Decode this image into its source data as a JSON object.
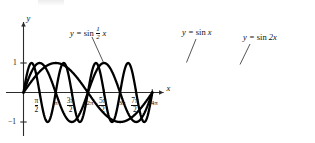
{
  "figure": {
    "axes": {
      "x_axis_label": "x",
      "y_axis_label": "y",
      "x_ticks": [
        {
          "value_pi": 0.5,
          "label_num": "π",
          "label_den": "2",
          "is_fraction": true
        },
        {
          "value_pi": 1.0,
          "label": "π",
          "is_fraction": false
        },
        {
          "value_pi": 1.5,
          "label_num": "3π",
          "label_den": "2",
          "is_fraction": true
        },
        {
          "value_pi": 2.0,
          "label": "2π",
          "is_fraction": false
        },
        {
          "value_pi": 2.5,
          "label_num": "5π",
          "label_den": "2",
          "is_fraction": true
        },
        {
          "value_pi": 3.0,
          "label": "3π",
          "is_fraction": false
        },
        {
          "value_pi": 3.5,
          "label_num": "7π",
          "label_den": "2",
          "is_fraction": true
        },
        {
          "value_pi": 4.0,
          "label": "4π",
          "is_fraction": false
        }
      ],
      "y_ticks": [
        {
          "value": 1,
          "label": "1"
        },
        {
          "value": -1,
          "label": "−1"
        }
      ],
      "xlim_pi": [
        0,
        4.35
      ],
      "ylim": [
        -1.35,
        1.35
      ],
      "grid": false
    },
    "curve_labels": [
      {
        "id": "sin-half-x",
        "prefix": "y = ",
        "fn": "sin ",
        "num": "1",
        "den": "2",
        "suffix": " x",
        "is_fraction": true
      },
      {
        "id": "sin-x",
        "prefix": "y = ",
        "fn": "sin ",
        "suffix": " x",
        "is_fraction": false
      },
      {
        "id": "sin-2x",
        "prefix": "y = ",
        "fn": "sin ",
        "suffix": " 2x",
        "is_fraction": false
      }
    ]
  },
  "chart_data": {
    "type": "line",
    "title": "",
    "xlabel": "x",
    "ylabel": "y",
    "xlim": [
      0,
      13.66
    ],
    "ylim": [
      -1.35,
      1.35
    ],
    "grid": false,
    "legend_position": "inline-callouts",
    "x_tick_values": [
      1.5708,
      3.1416,
      4.7124,
      6.2832,
      7.854,
      9.4248,
      10.9956,
      12.5664
    ],
    "x_tick_labels": [
      "π/2",
      "π",
      "3π/2",
      "2π",
      "5π/2",
      "3π",
      "7π/2",
      "4π"
    ],
    "y_tick_values": [
      1,
      -1
    ],
    "y_tick_labels": [
      "1",
      "−1"
    ],
    "series": [
      {
        "name": "y = sin 1/2 x",
        "expression": "sin(0.5*x)",
        "frequency": 0.5,
        "amplitude": 1,
        "period_pi": 4,
        "color": "#000000",
        "key_points": [
          {
            "x_pi": 0,
            "y": 0
          },
          {
            "x_pi": 1,
            "y": 1
          },
          {
            "x_pi": 2,
            "y": 0
          },
          {
            "x_pi": 3,
            "y": -1
          },
          {
            "x_pi": 4,
            "y": 0
          }
        ]
      },
      {
        "name": "y = sin x",
        "expression": "sin(x)",
        "frequency": 1,
        "amplitude": 1,
        "period_pi": 2,
        "color": "#000000",
        "key_points": [
          {
            "x_pi": 0,
            "y": 0
          },
          {
            "x_pi": 0.5,
            "y": 1
          },
          {
            "x_pi": 1,
            "y": 0
          },
          {
            "x_pi": 1.5,
            "y": -1
          },
          {
            "x_pi": 2,
            "y": 0
          },
          {
            "x_pi": 2.5,
            "y": 1
          },
          {
            "x_pi": 3,
            "y": 0
          },
          {
            "x_pi": 3.5,
            "y": -1
          },
          {
            "x_pi": 4,
            "y": 0
          }
        ]
      },
      {
        "name": "y = sin 2x",
        "expression": "sin(2*x)",
        "frequency": 2,
        "amplitude": 1,
        "period_pi": 1,
        "color": "#000000",
        "key_points": [
          {
            "x_pi": 0,
            "y": 0
          },
          {
            "x_pi": 0.25,
            "y": 1
          },
          {
            "x_pi": 0.5,
            "y": 0
          },
          {
            "x_pi": 0.75,
            "y": -1
          },
          {
            "x_pi": 1,
            "y": 0
          },
          {
            "x_pi": 1.25,
            "y": 1
          },
          {
            "x_pi": 1.5,
            "y": 0
          },
          {
            "x_pi": 1.75,
            "y": -1
          },
          {
            "x_pi": 2,
            "y": 0
          },
          {
            "x_pi": 2.25,
            "y": 1
          },
          {
            "x_pi": 2.5,
            "y": 0
          },
          {
            "x_pi": 2.75,
            "y": -1
          },
          {
            "x_pi": 3,
            "y": 0
          },
          {
            "x_pi": 3.25,
            "y": 1
          },
          {
            "x_pi": 3.5,
            "y": 0
          },
          {
            "x_pi": 3.75,
            "y": -1
          },
          {
            "x_pi": 4,
            "y": 0
          }
        ]
      }
    ]
  }
}
